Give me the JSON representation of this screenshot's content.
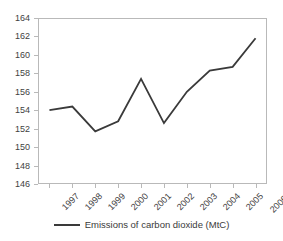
{
  "chart_data": {
    "type": "line",
    "title": "",
    "xlabel": "",
    "ylabel": "",
    "categories": [
      "1997",
      "1998",
      "1999",
      "2000",
      "2001",
      "2002",
      "2003",
      "2004",
      "2005",
      "2006*"
    ],
    "series": [
      {
        "name": "Emissions of carbon dioxide (MtC)",
        "values": [
          154.0,
          154.4,
          151.7,
          152.8,
          157.4,
          152.6,
          156.0,
          158.3,
          158.7,
          161.8
        ],
        "color": "#3a3a3a"
      }
    ],
    "ylim": [
      146,
      164
    ],
    "yticks": [
      146,
      148,
      150,
      152,
      154,
      156,
      158,
      160,
      162,
      164
    ],
    "ytick_step": 2,
    "grid": false,
    "legend_position": "bottom",
    "frame_color": "#b9b9b9",
    "background": "#ffffff"
  },
  "legend": {
    "label": "Emissions of carbon dioxide (MtC)"
  }
}
